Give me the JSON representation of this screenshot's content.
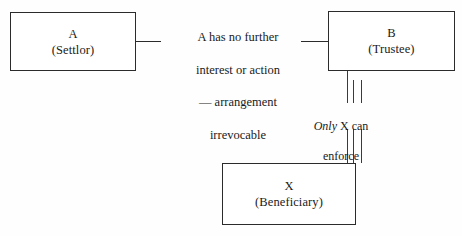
{
  "diagram": {
    "background_color": "#fefefe",
    "line_color": "#2b2b2b",
    "text_color": "#1a1a1a",
    "nodes": [
      {
        "id": "a",
        "label": "A",
        "sublabel": "(Settlor)"
      },
      {
        "id": "b",
        "label": "B",
        "sublabel": "(Trustee)"
      },
      {
        "id": "x",
        "label": "X",
        "sublabel": "(Beneficiary)"
      }
    ],
    "annotations": {
      "settlor_to_trustee": {
        "line_1": "A has no further",
        "line_2": "interest or action",
        "line_3": "— arrangement",
        "line_4": "irrevocable",
        "full_text": "A has no further interest or action — arrangement irrevocable"
      },
      "trustee_to_beneficiary": {
        "emphasis_word": "Only",
        "rest_line_1": " X can",
        "line_2": "enforce",
        "full_text": "Only X can enforce"
      }
    }
  }
}
